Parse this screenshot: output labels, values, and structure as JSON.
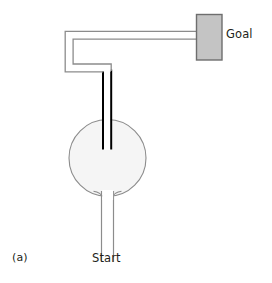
{
  "figure": {
    "panel_id": "(a)",
    "type": "maze-diagram",
    "background_color": "#ffffff"
  },
  "labels": {
    "start": "Start",
    "goal": "Goal",
    "panel": "(a)"
  },
  "colors": {
    "wall_gray": "#8c8c8c",
    "wall_black": "#000000",
    "arena_fill": "#f5f5f5",
    "arena_stroke": "#8c8c8c",
    "goal_fill": "#c4c4c4",
    "goal_stroke": "#6e6e6e",
    "text": "#231f20",
    "background": "#ffffff"
  },
  "geometry": {
    "arena": {
      "cx": 107.5,
      "cy": 158,
      "r": 38.5
    },
    "goal_box": {
      "x": 196,
      "y": 14,
      "width": 26,
      "height": 46
    },
    "start_corridor": {
      "x_left": 101,
      "x_right": 113,
      "y_top": 197,
      "y_bottom": 262
    },
    "choice_corridor": {
      "x_left": 102,
      "x_right": 112,
      "y_top": 71,
      "y_bottom": 149
    },
    "top_corridor": {
      "y_top": 31,
      "y_bottom": 39,
      "x_left": 65,
      "x_right": 197
    },
    "left_corridor": {
      "x_left": 65,
      "x_right": 73,
      "y_top": 31,
      "y_bottom": 71
    }
  },
  "elements": [
    {
      "name": "goal-box",
      "label": "Goal"
    },
    {
      "name": "start-corridor",
      "label": "Start"
    },
    {
      "name": "circular-arena",
      "label": ""
    },
    {
      "name": "black-wall-corridor",
      "label": ""
    }
  ]
}
